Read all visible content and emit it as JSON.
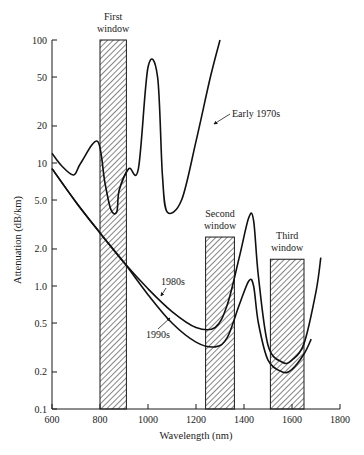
{
  "chart_data": {
    "type": "line",
    "title": "",
    "xlabel": "Wavelength (nm)",
    "ylabel": "Attenuation (dB/km)",
    "xlim": [
      600,
      1800
    ],
    "ylim": [
      0.1,
      100
    ],
    "yscale": "log",
    "grid": false,
    "x_ticks": [
      600,
      800,
      1000,
      1200,
      1400,
      1600,
      1800
    ],
    "y_ticks": [
      {
        "value": 100,
        "label": "100"
      },
      {
        "value": 50,
        "label": "50"
      },
      {
        "value": 20,
        "label": "20"
      },
      {
        "value": 10,
        "label": "10"
      },
      {
        "value": 5,
        "label": "5.0"
      },
      {
        "value": 2,
        "label": "2.0"
      },
      {
        "value": 1,
        "label": "1.0"
      },
      {
        "value": 0.5,
        "label": "0.5"
      },
      {
        "value": 0.2,
        "label": "0.2"
      },
      {
        "value": 0.1,
        "label": "0.1"
      }
    ],
    "windows": [
      {
        "name": "First window",
        "label_lines": [
          "First",
          "window"
        ],
        "x_start": 800,
        "x_end": 910,
        "top": 100
      },
      {
        "name": "Second window",
        "label_lines": [
          "Second",
          "window"
        ],
        "x_start": 1240,
        "x_end": 1360,
        "top": 2.5
      },
      {
        "name": "Third window",
        "label_lines": [
          "Third",
          "window"
        ],
        "x_start": 1510,
        "x_end": 1650,
        "top": 1.65
      }
    ],
    "series": [
      {
        "name": "Early 1970s",
        "x": [
          600,
          640,
          690,
          720,
          790,
          820,
          845,
          870,
          880,
          920,
          960,
          1000,
          1040,
          1060,
          1080,
          1140,
          1200,
          1260,
          1300
        ],
        "values": [
          12,
          9.5,
          8,
          10,
          15,
          7,
          4.2,
          4,
          6,
          9,
          9,
          60,
          50,
          8,
          4,
          5,
          15,
          50,
          100
        ]
      },
      {
        "name": "1980s",
        "x": [
          600,
          700,
          800,
          900,
          1000,
          1100,
          1200,
          1280,
          1330,
          1380,
          1420,
          1440,
          1460,
          1500,
          1560,
          1600,
          1650,
          1700,
          1720
        ],
        "values": [
          9,
          4.8,
          2.7,
          1.55,
          0.95,
          0.62,
          0.46,
          0.46,
          0.7,
          1.7,
          3.6,
          3.4,
          1.2,
          0.33,
          0.24,
          0.25,
          0.34,
          0.9,
          1.7
        ]
      },
      {
        "name": "1990s",
        "x": [
          600,
          700,
          800,
          900,
          1000,
          1100,
          1200,
          1280,
          1330,
          1380,
          1420,
          1440,
          1460,
          1500,
          1560,
          1600,
          1650,
          1680
        ],
        "values": [
          9,
          4.8,
          2.7,
          1.55,
          0.85,
          0.5,
          0.35,
          0.32,
          0.38,
          0.7,
          1.1,
          1.0,
          0.5,
          0.25,
          0.2,
          0.21,
          0.28,
          0.37
        ]
      }
    ],
    "annotations": [
      {
        "text": "Early 1970s",
        "points_to": "Early 1970s"
      },
      {
        "text": "1980s",
        "points_to": "1980s"
      },
      {
        "text": "1990s",
        "points_to": "1990s"
      }
    ]
  }
}
